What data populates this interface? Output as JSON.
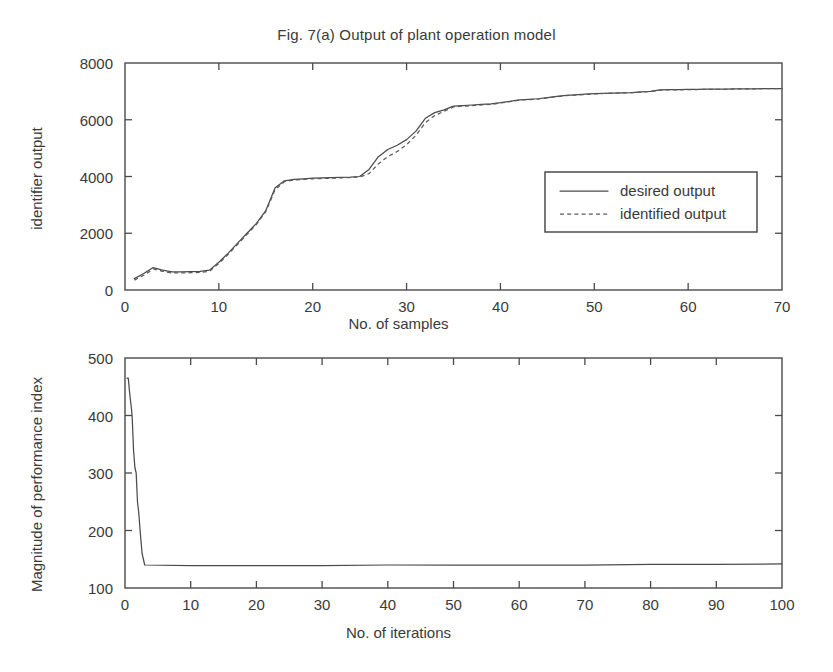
{
  "figure": {
    "title": "Fig. 7(a) Output of plant operation model"
  },
  "chart_data": [
    {
      "type": "line",
      "title": "Fig. 7(a) Output of plant operation model",
      "xlabel": "No. of samples",
      "ylabel": "identifier output",
      "xlim": [
        0,
        70
      ],
      "ylim": [
        0,
        8000
      ],
      "xticks": [
        0,
        10,
        20,
        30,
        40,
        50,
        60,
        70
      ],
      "yticks": [
        0,
        2000,
        4000,
        6000,
        8000
      ],
      "grid": false,
      "legend_position": "center-right",
      "series": [
        {
          "name": "desired output",
          "style": "solid",
          "x": [
            1,
            2,
            3,
            4,
            5,
            6,
            7,
            8,
            9,
            10,
            11,
            12,
            13,
            14,
            15,
            16,
            17,
            18,
            19,
            20,
            21,
            22,
            23,
            24,
            25,
            26,
            27,
            28,
            29,
            30,
            31,
            32,
            33,
            34,
            35,
            36,
            37,
            38,
            39,
            40,
            41,
            42,
            43,
            44,
            45,
            46,
            47,
            48,
            49,
            50,
            51,
            52,
            53,
            54,
            55,
            56,
            57,
            58,
            59,
            60,
            61,
            62,
            63,
            64,
            65,
            66,
            67,
            68,
            69,
            70
          ],
          "values": [
            400,
            580,
            790,
            700,
            640,
            640,
            650,
            660,
            700,
            980,
            1300,
            1650,
            2000,
            2350,
            2800,
            3600,
            3850,
            3900,
            3920,
            3940,
            3950,
            3960,
            3970,
            3980,
            4000,
            4250,
            4700,
            4950,
            5100,
            5300,
            5600,
            6050,
            6250,
            6350,
            6480,
            6500,
            6520,
            6540,
            6560,
            6600,
            6650,
            6700,
            6720,
            6740,
            6780,
            6820,
            6860,
            6880,
            6900,
            6920,
            6930,
            6940,
            6950,
            6960,
            6980,
            7000,
            7050,
            7060,
            7060,
            7070,
            7070,
            7080,
            7080,
            7080,
            7090,
            7090,
            7090,
            7100,
            7100,
            7100
          ]
        },
        {
          "name": "identified output",
          "style": "dashed",
          "x": [
            1,
            2,
            3,
            4,
            5,
            6,
            7,
            8,
            9,
            10,
            11,
            12,
            13,
            14,
            15,
            16,
            17,
            18,
            19,
            20,
            21,
            22,
            23,
            24,
            25,
            26,
            27,
            28,
            29,
            30,
            31,
            32,
            33,
            34,
            35,
            36,
            37,
            38,
            39,
            40,
            41,
            42,
            43,
            44,
            45,
            46,
            47,
            48,
            49,
            50,
            51,
            52,
            53,
            54,
            55,
            56,
            57,
            58,
            59,
            60,
            61,
            62,
            63,
            64,
            65,
            66,
            67,
            68,
            69,
            70
          ],
          "values": [
            350,
            520,
            740,
            660,
            600,
            600,
            610,
            620,
            660,
            940,
            1260,
            1610,
            1960,
            2310,
            2760,
            3540,
            3820,
            3880,
            3900,
            3920,
            3930,
            3940,
            3950,
            3960,
            3980,
            4100,
            4450,
            4700,
            4880,
            5120,
            5450,
            5900,
            6150,
            6300,
            6450,
            6480,
            6500,
            6520,
            6540,
            6590,
            6640,
            6690,
            6710,
            6730,
            6770,
            6810,
            6850,
            6870,
            6890,
            6910,
            6925,
            6935,
            6945,
            6955,
            6975,
            6995,
            7045,
            7055,
            7055,
            7065,
            7065,
            7075,
            7075,
            7075,
            7085,
            7085,
            7085,
            7095,
            7095,
            7095
          ]
        }
      ],
      "legend": [
        "desired output",
        "identified output"
      ]
    },
    {
      "type": "line",
      "title": "",
      "xlabel": "No. of iterations",
      "ylabel": "Magnitude of performance index",
      "xlim": [
        0,
        100
      ],
      "ylim": [
        100,
        500
      ],
      "xticks": [
        0,
        10,
        20,
        30,
        40,
        50,
        60,
        70,
        80,
        90,
        100
      ],
      "yticks": [
        100,
        200,
        300,
        400,
        500
      ],
      "grid": false,
      "legend_position": "none",
      "series": [
        {
          "name": "performance index",
          "style": "solid",
          "x": [
            0.3,
            0.5,
            0.7,
            0.9,
            1.0,
            1.1,
            1.3,
            1.5,
            1.7,
            1.9,
            2.1,
            2.3,
            2.6,
            3.0,
            10,
            20,
            30,
            40,
            50,
            60,
            70,
            80,
            90,
            100
          ],
          "values": [
            465,
            465,
            440,
            420,
            410,
            395,
            340,
            310,
            300,
            250,
            230,
            200,
            160,
            140,
            139,
            139,
            139,
            140,
            140,
            140,
            140,
            141,
            141,
            142
          ]
        }
      ],
      "legend": []
    }
  ]
}
